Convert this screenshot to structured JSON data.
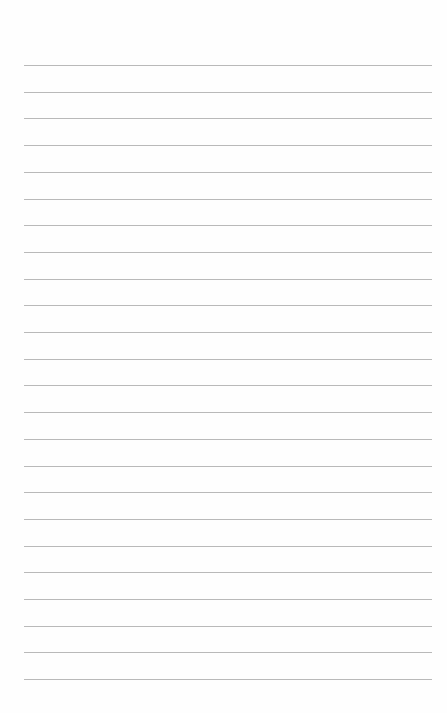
{
  "page": {
    "type": "lined-paper",
    "background": "#fefefe",
    "rule_color": "#b9b9b9",
    "rule_count": 24,
    "first_rule_y": 65,
    "rule_spacing": 26.7,
    "rule_left": 24,
    "rule_width": 408
  }
}
